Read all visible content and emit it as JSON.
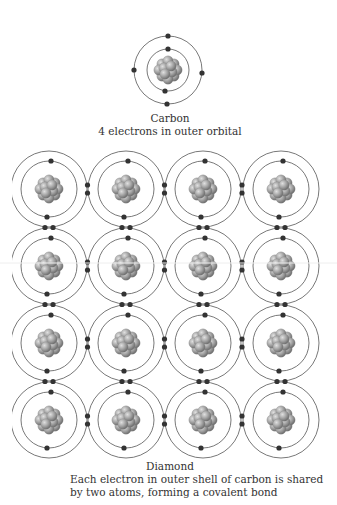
{
  "carbon": {
    "title": "Carbon",
    "subtitle": "4 electrons in outer orbital",
    "center": [
      168,
      70
    ],
    "inner_radius": 28,
    "outer_radius": 38,
    "electrons": 6
  },
  "diamond": {
    "title": "Diamond",
    "line1": "Each electron in outer shell of carbon is shared",
    "line2": "by two atoms, forming a covalent bond",
    "grid": {
      "cols": [
        49,
        126,
        203,
        281
      ],
      "rows": [
        189,
        266,
        343,
        420
      ],
      "inner_radius": 28,
      "outer_radius": 38
    }
  },
  "colors": {
    "orbit": "#555555",
    "electron": "#333333",
    "nucleus": "#999999",
    "text": "#333333"
  }
}
